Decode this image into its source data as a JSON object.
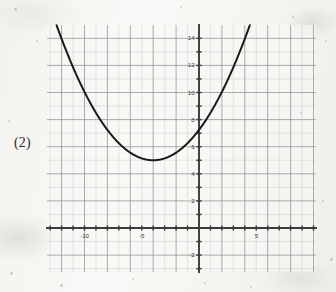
{
  "figure": {
    "problem_label": "(2)",
    "background_color": "#f5f4f1",
    "curve_color": "#1a1a1a",
    "axis_color": "#3c3c3c",
    "major_grid_color": "#8e8e96",
    "minor_grid_color": "#c3c3cb"
  },
  "chart_data": {
    "type": "line",
    "title": "",
    "subtitle": "",
    "xlabel": "",
    "ylabel": "",
    "grid": true,
    "legend_position": "none",
    "annotations": [
      "(2)"
    ],
    "xlim": [
      -13.3,
      10.3
    ],
    "ylim": [
      -3.3,
      15.3
    ],
    "x_ticks_major": [
      -10,
      -5,
      5
    ],
    "x_tick_labels": [
      "-10",
      "-5",
      "5"
    ],
    "y_ticks_major": [
      -2,
      2,
      4,
      6,
      8,
      10,
      12,
      14
    ],
    "y_tick_labels": [
      "-2",
      "2",
      "4",
      "6",
      "8",
      "10",
      "12",
      "14"
    ],
    "x_tick_step_minor": 1,
    "y_tick_step_minor": 1,
    "x_gridline_step": 2,
    "y_gridline_step": 2,
    "series": [
      {
        "name": "parabola",
        "equation": "y = 0.14(x + 4)^2 + 5",
        "vertex": [
          -4,
          5
        ],
        "leading_coefficient": 0.14,
        "x": [
          -12.0,
          -11.0,
          -10.0,
          -9.0,
          -8.0,
          -7.0,
          -6.0,
          -5.0,
          -4.0,
          -3.0,
          -2.0,
          -1.0,
          0.0,
          1.0,
          2.0,
          3.0,
          4.0
        ],
        "values": [
          13.96,
          11.86,
          10.04,
          8.5,
          7.24,
          6.26,
          5.56,
          5.14,
          5.0,
          5.14,
          5.56,
          6.26,
          7.24,
          8.5,
          10.04,
          11.86,
          13.96
        ]
      }
    ]
  }
}
